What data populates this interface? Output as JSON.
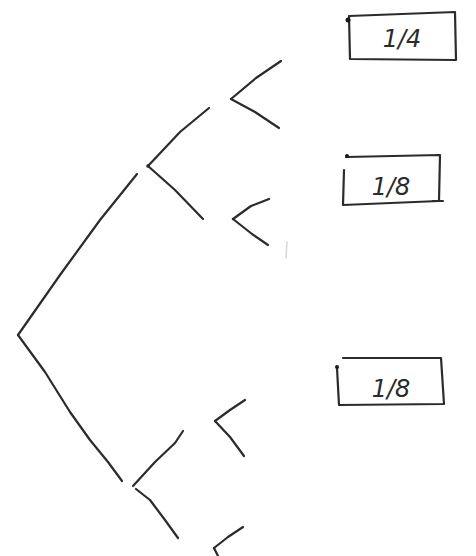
{
  "diagram": {
    "type": "probability-tree",
    "style": "hand-drawn",
    "stroke_color": "#2b2b2b",
    "background": "#ffffff",
    "nodes": [
      {
        "id": "root",
        "label": "",
        "position": [
          18,
          335
        ]
      },
      {
        "id": "upper",
        "label": "",
        "position": [
          148,
          166
        ]
      },
      {
        "id": "lower",
        "label": "",
        "position": [
          133,
          486
        ]
      },
      {
        "id": "upper-upper",
        "label": "",
        "position": [
          231,
          99
        ]
      },
      {
        "id": "upper-lower",
        "label": "",
        "position": [
          233,
          219
        ]
      },
      {
        "id": "lower-upper",
        "label": "",
        "position": [
          215,
          421
        ]
      },
      {
        "id": "lower-lower",
        "label": "",
        "position": [
          214,
          548
        ]
      }
    ],
    "edges": [
      {
        "from": "root",
        "to": "upper"
      },
      {
        "from": "root",
        "to": "lower"
      },
      {
        "from": "upper",
        "to": "upper-upper"
      },
      {
        "from": "upper",
        "to": "upper-lower"
      },
      {
        "from": "lower",
        "to": "lower-upper"
      },
      {
        "from": "lower",
        "to": "lower-lower"
      }
    ],
    "labels": [
      {
        "id": "box-1",
        "text": "1/4",
        "numerator": "1",
        "denominator": "4",
        "near_branch": "upper-upper"
      },
      {
        "id": "box-2",
        "text": "1/8",
        "numerator": "1",
        "denominator": "8",
        "near_branch": "upper-lower"
      },
      {
        "id": "box-3",
        "text": "1/8",
        "numerator": "1",
        "denominator": "8",
        "near_branch": "lower-upper"
      }
    ]
  }
}
